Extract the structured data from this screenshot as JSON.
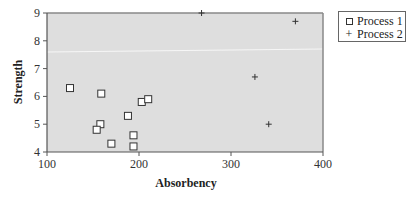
{
  "chart_data": {
    "type": "scatter",
    "title": "",
    "xlabel": "Absorbency",
    "ylabel": "Strength",
    "xlim": [
      100,
      400
    ],
    "ylim": [
      4,
      9
    ],
    "xticks": [
      100,
      200,
      300,
      400
    ],
    "yticks": [
      4,
      5,
      6,
      7,
      8,
      9
    ],
    "grid": false,
    "legend_position": "right-top",
    "series": [
      {
        "name": "Process 1",
        "marker": "open-square",
        "points": [
          {
            "x": 125,
            "y": 6.3
          },
          {
            "x": 159,
            "y": 6.1
          },
          {
            "x": 158,
            "y": 5.0
          },
          {
            "x": 154,
            "y": 4.8
          },
          {
            "x": 170,
            "y": 4.3
          },
          {
            "x": 203,
            "y": 5.8
          },
          {
            "x": 210,
            "y": 5.9
          },
          {
            "x": 188,
            "y": 5.3
          },
          {
            "x": 194,
            "y": 4.6
          },
          {
            "x": 194,
            "y": 4.2
          }
        ]
      },
      {
        "name": "Process 2",
        "marker": "plus",
        "points": [
          {
            "x": 268,
            "y": 9.0
          },
          {
            "x": 370,
            "y": 8.7
          },
          {
            "x": 326,
            "y": 6.7
          },
          {
            "x": 341,
            "y": 5.0
          }
        ]
      }
    ]
  },
  "legend": {
    "items": [
      {
        "label": "Process 1",
        "symbol": "square-icon"
      },
      {
        "label": "Process 2",
        "symbol": "+"
      }
    ]
  },
  "colors": {
    "plot_background": "#dedede",
    "axis": "#555555",
    "frame": "#888888",
    "marker": "#333333"
  }
}
